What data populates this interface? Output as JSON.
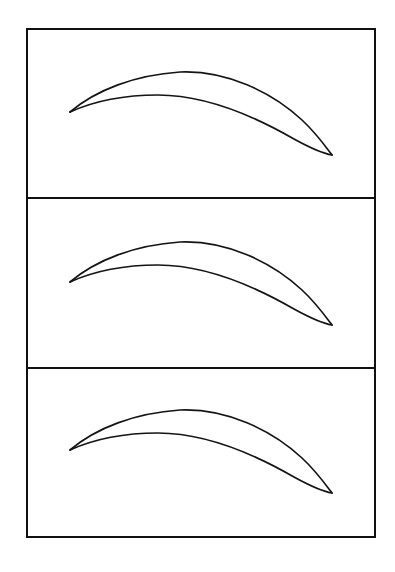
{
  "figure": {
    "canvas": {
      "width": 395,
      "height": 572
    },
    "background_color": "#ffffff",
    "line_color": "#141414",
    "frame_color": "#111111",
    "frame": {
      "x": 27,
      "y": 29,
      "width": 348,
      "height": 508,
      "stroke_width": 2.4
    },
    "dividers": [
      {
        "name": "divider-1",
        "y": 198
      },
      {
        "name": "divider-2",
        "y": 368
      }
    ],
    "panels": [
      {
        "name": "panel-top",
        "index": 1,
        "rect": {
          "x": 27,
          "y": 29,
          "width": 348,
          "height": 169
        },
        "airfoil": {
          "name": "airfoil-profile-1",
          "leading_edge": {
            "x": 70,
            "y": 112
          },
          "trailing_edge": {
            "x": 332,
            "y": 155
          },
          "chord_length": 265,
          "upper_surface_path": "M 70 112 C 96 90, 135 75, 180 72 C 226 70, 272 92, 302 120 C 316 133, 326 147, 332 155",
          "lower_surface_path": "M 70 112 C 92 102, 122 95, 158 95 C 205 95, 254 116, 294 139 C 314 150, 326 154, 332 155",
          "max_camber_upper": {
            "x": 188,
            "y": 72
          },
          "max_camber_lower": {
            "x": 160,
            "y": 95
          },
          "stroke_width": 1.7
        }
      },
      {
        "name": "panel-middle",
        "index": 2,
        "rect": {
          "x": 27,
          "y": 198,
          "width": 348,
          "height": 170
        },
        "airfoil": {
          "name": "airfoil-profile-2",
          "leading_edge": {
            "x": 70,
            "y": 282
          },
          "trailing_edge": {
            "x": 332,
            "y": 325
          },
          "chord_length": 265,
          "upper_surface_path": "M 70 282 C 96 260, 135 245, 180 242 C 226 240, 272 262, 302 290 C 316 303, 326 317, 332 325",
          "lower_surface_path": "M 70 282 C 92 272, 122 265, 158 265 C 205 265, 254 286, 294 309 C 314 320, 326 324, 332 325",
          "max_camber_upper": {
            "x": 188,
            "y": 242
          },
          "max_camber_lower": {
            "x": 160,
            "y": 265
          },
          "stroke_width": 1.7
        }
      },
      {
        "name": "panel-bottom",
        "index": 3,
        "rect": {
          "x": 27,
          "y": 368,
          "width": 348,
          "height": 169
        },
        "airfoil": {
          "name": "airfoil-profile-3",
          "leading_edge": {
            "x": 70,
            "y": 450
          },
          "trailing_edge": {
            "x": 332,
            "y": 493
          },
          "chord_length": 265,
          "upper_surface_path": "M 70 450 C 96 428, 135 413, 180 410 C 226 408, 272 430, 302 458 C 316 471, 326 485, 332 493",
          "lower_surface_path": "M 70 450 C 92 440, 122 433, 158 433 C 205 433, 254 454, 294 477 C 314 488, 326 492, 332 493",
          "max_camber_upper": {
            "x": 188,
            "y": 410
          },
          "max_camber_lower": {
            "x": 160,
            "y": 433
          },
          "stroke_width": 1.7
        }
      }
    ]
  }
}
